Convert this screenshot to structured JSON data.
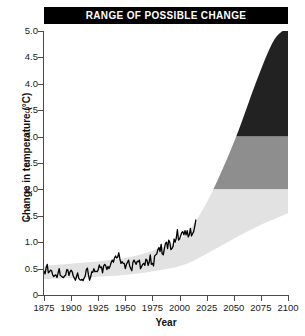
{
  "title": "RANGE OF POSSIBLE CHANGE",
  "axes": {
    "xlabel": "Year",
    "ylabel": "Change in temperature (°C)",
    "xticks": [
      1875,
      1900,
      1925,
      1950,
      1975,
      2000,
      2025,
      2050,
      2075,
      2100
    ],
    "yticks": [
      "0",
      "0.5",
      "1.0",
      "1.5",
      "2.0",
      "2.5",
      "3.0",
      "3.5",
      "4.0",
      "4.5",
      "5.0"
    ],
    "xlim": [
      1875,
      2100
    ],
    "ylim": [
      0,
      5
    ]
  },
  "colors": {
    "title_bar": "#000000",
    "title_text": "#ffffff",
    "band_high": "#222222",
    "band_mid": "#8e8e8e",
    "band_low": "#e2e2e2",
    "observed_line": "#000000",
    "axis": "#4a4a4a",
    "background": "#ffffff"
  },
  "chart_data": {
    "type": "area",
    "title": "RANGE OF POSSIBLE CHANGE",
    "xlabel": "Year",
    "ylabel": "Change in temperature (°C)",
    "xlim": [
      1875,
      2100
    ],
    "ylim": [
      0,
      5
    ],
    "grid": false,
    "legend": "none",
    "bands": [
      {
        "name": "high-range-band",
        "color": "#222222",
        "y_from": 3.0,
        "y_to": 5.0
      },
      {
        "name": "mid-range-band",
        "color": "#8e8e8e",
        "y_from": 2.0,
        "y_to": 3.0
      },
      {
        "name": "low-range-band",
        "color": "#e2e2e2",
        "y_from": 0.0,
        "y_to": 2.0
      }
    ],
    "projection_envelope": {
      "name": "range-of-possible-change-wedge",
      "color": "#e2e2e2",
      "description": "Light wedge widening after 2000; area outside the wedge is masked white so only the wedge shows the shaded range bands beneath it.",
      "upper": {
        "x": [
          1875,
          1950,
          1990,
          2000,
          2010,
          2025,
          2040,
          2055,
          2070,
          2085,
          2095,
          2100
        ],
        "y": [
          0.55,
          0.7,
          0.95,
          1.05,
          1.25,
          1.75,
          2.4,
          3.15,
          4.0,
          4.75,
          5.0,
          5.0
        ]
      },
      "lower": {
        "x": [
          1875,
          1950,
          1990,
          2000,
          2010,
          2025,
          2040,
          2055,
          2070,
          2085,
          2100
        ],
        "y": [
          0.3,
          0.38,
          0.5,
          0.55,
          0.62,
          0.78,
          0.95,
          1.12,
          1.28,
          1.42,
          1.55
        ]
      }
    },
    "series": [
      {
        "name": "Observed global temperature change",
        "type": "line",
        "color": "#000000",
        "x": [
          1875,
          1876,
          1877,
          1878,
          1879,
          1880,
          1881,
          1882,
          1883,
          1884,
          1885,
          1886,
          1887,
          1888,
          1889,
          1890,
          1891,
          1892,
          1893,
          1894,
          1895,
          1896,
          1897,
          1898,
          1899,
          1900,
          1901,
          1902,
          1903,
          1904,
          1905,
          1906,
          1907,
          1908,
          1909,
          1910,
          1911,
          1912,
          1913,
          1914,
          1915,
          1916,
          1917,
          1918,
          1919,
          1920,
          1921,
          1922,
          1923,
          1924,
          1925,
          1926,
          1927,
          1928,
          1929,
          1930,
          1931,
          1932,
          1933,
          1934,
          1935,
          1936,
          1937,
          1938,
          1939,
          1940,
          1941,
          1942,
          1943,
          1944,
          1945,
          1946,
          1947,
          1948,
          1949,
          1950,
          1951,
          1952,
          1953,
          1954,
          1955,
          1956,
          1957,
          1958,
          1959,
          1960,
          1961,
          1962,
          1963,
          1964,
          1965,
          1966,
          1967,
          1968,
          1969,
          1970,
          1971,
          1972,
          1973,
          1974,
          1975,
          1976,
          1977,
          1978,
          1979,
          1980,
          1981,
          1982,
          1983,
          1984,
          1985,
          1986,
          1987,
          1988,
          1989,
          1990,
          1991,
          1992,
          1993,
          1994,
          1995,
          1996,
          1997,
          1998,
          1999,
          2000,
          2001,
          2002,
          2003,
          2004,
          2005,
          2006,
          2007,
          2008,
          2009,
          2010,
          2011,
          2012,
          2013,
          2014,
          2015
        ],
        "y": [
          0.45,
          0.4,
          0.52,
          0.58,
          0.42,
          0.44,
          0.47,
          0.46,
          0.38,
          0.35,
          0.37,
          0.38,
          0.33,
          0.42,
          0.5,
          0.37,
          0.36,
          0.34,
          0.33,
          0.36,
          0.38,
          0.48,
          0.47,
          0.37,
          0.44,
          0.47,
          0.44,
          0.36,
          0.32,
          0.28,
          0.35,
          0.42,
          0.32,
          0.29,
          0.28,
          0.3,
          0.27,
          0.32,
          0.36,
          0.48,
          0.51,
          0.38,
          0.28,
          0.34,
          0.44,
          0.43,
          0.5,
          0.44,
          0.45,
          0.44,
          0.48,
          0.57,
          0.52,
          0.53,
          0.42,
          0.55,
          0.58,
          0.55,
          0.48,
          0.54,
          0.5,
          0.55,
          0.62,
          0.66,
          0.62,
          0.7,
          0.74,
          0.7,
          0.72,
          0.8,
          0.68,
          0.6,
          0.63,
          0.6,
          0.6,
          0.5,
          0.58,
          0.62,
          0.66,
          0.55,
          0.5,
          0.46,
          0.62,
          0.66,
          0.62,
          0.58,
          0.64,
          0.63,
          0.66,
          0.5,
          0.54,
          0.58,
          0.6,
          0.56,
          0.68,
          0.66,
          0.56,
          0.62,
          0.76,
          0.58,
          0.6,
          0.55,
          0.74,
          0.76,
          0.78,
          0.86,
          0.9,
          0.82,
          0.96,
          0.78,
          0.76,
          0.88,
          0.98,
          1.0,
          0.88,
          1.04,
          1.0,
          0.86,
          0.88,
          0.92,
          1.06,
          1.0,
          1.08,
          1.24,
          1.04,
          1.06,
          1.12,
          1.18,
          1.2,
          1.14,
          1.22,
          1.14,
          1.22,
          1.1,
          1.14,
          1.26,
          1.12,
          1.16,
          1.2,
          1.3,
          1.42
        ]
      }
    ]
  }
}
